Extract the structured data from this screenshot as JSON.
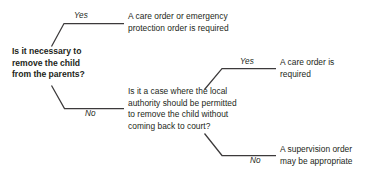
{
  "diagram": {
    "background_color": "#ffffff",
    "line_color": "#231f20",
    "text_color": "#231f20",
    "nodes": {
      "root_question": "Is it necessary to\nremove the child\nfrom the parents?",
      "outcome_care_emergency": "A care order or emergency\nprotection order is required",
      "mid_question": "Is it a case where the local\nauthority should be permitted\nto remove the child without\ncoming back to court?",
      "outcome_care_order": "A care order is\nrequired",
      "outcome_supervision": "A supervision order\nmay be appropriate"
    },
    "edge_labels": {
      "yes_root": "Yes",
      "no_root": "No",
      "yes_mid": "Yes",
      "no_mid": "No"
    }
  }
}
